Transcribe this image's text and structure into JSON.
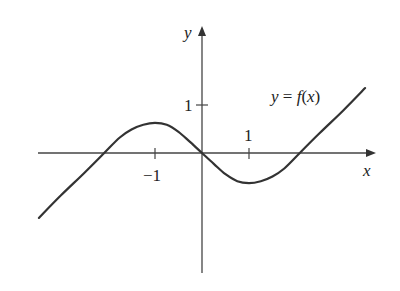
{
  "chart_data": {
    "type": "line",
    "title": "",
    "curve_label": "y = f(x)",
    "curve_label_parts": {
      "lhs": "y",
      "eq": " = ",
      "f": "f",
      "open": "(",
      "arg": "x",
      "close": ")"
    },
    "xlabel": "x",
    "ylabel": "y",
    "x_ticks": [
      {
        "value": -1,
        "label": "−1"
      },
      {
        "value": 1,
        "label": "1"
      }
    ],
    "y_ticks": [
      {
        "value": 1,
        "label": "1"
      }
    ],
    "xlim": [
      -3.5,
      3.7
    ],
    "ylim": [
      -2.5,
      2.7
    ],
    "grid": false,
    "legend": "none",
    "series": [
      {
        "name": "f(x)",
        "x": [
          -3.47,
          -3.0,
          -2.5,
          -2.08,
          -1.75,
          -1.5,
          -1.25,
          -1.0,
          -0.75,
          -0.5,
          -0.25,
          0.0,
          0.25,
          0.5,
          0.75,
          1.0,
          1.25,
          1.5,
          1.75,
          2.08,
          2.5,
          3.0,
          3.47
        ],
        "y": [
          -1.38,
          -0.9,
          -0.42,
          0.0,
          0.33,
          0.5,
          0.6,
          0.64,
          0.6,
          0.45,
          0.23,
          0.0,
          -0.23,
          -0.45,
          -0.6,
          -0.64,
          -0.6,
          -0.5,
          -0.33,
          0.0,
          0.42,
          0.9,
          1.38
        ]
      }
    ]
  },
  "colors": {
    "curve": "#333333",
    "axes": "#444444",
    "text": "#222222"
  }
}
